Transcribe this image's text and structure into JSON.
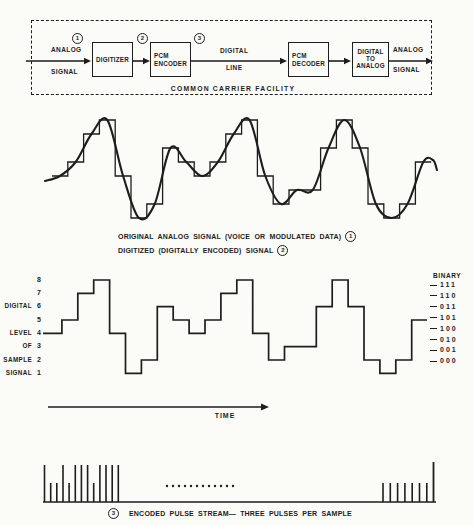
{
  "page": {
    "background": "#fbfbf8",
    "ink": "#1d1d1d"
  },
  "block_diagram": {
    "marker_1": "1",
    "marker_2": "2",
    "marker_3": "3",
    "input_top": "ANALOG",
    "input_bottom": "SIGNAL",
    "digitizer_label": "DIGITIZER",
    "encoder_line1": "PCM",
    "encoder_line2": "ENCODER",
    "line_label_top": "DIGITAL",
    "line_label_bottom": "LINE",
    "decoder_line1": "PCM",
    "decoder_line2": "DECODER",
    "da_line1": "DIGITAL",
    "da_line2": "TO",
    "da_line3": "ANALOG",
    "output_top": "ANALOG",
    "output_bottom": "SIGNAL",
    "facility_label": "COMMON CARRIER FACILITY"
  },
  "captions": {
    "analog_text": "ORIGINAL ANALOG SIGNAL (VOICE OR MODULATED DATA)",
    "analog_marker": "1",
    "digitized_text": "DIGITIZED (DIGITALLY ENCODED) SIGNAL",
    "digitized_marker": "2",
    "pulse_marker": "3",
    "pulse_text": "ENCODED PULSE STREAM— THREE PULSES PER SAMPLE"
  },
  "digital_chart": {
    "time_label": "TIME",
    "binary_header": "BINARY",
    "level_rows": [
      {
        "word": "",
        "num": "8"
      },
      {
        "word": "",
        "num": "7"
      },
      {
        "word": "DIGITAL",
        "num": "6"
      },
      {
        "word": "",
        "num": "5"
      },
      {
        "word": "LEVEL",
        "num": "4"
      },
      {
        "word": "OF",
        "num": "3"
      },
      {
        "word": "SAMPLE",
        "num": "2"
      },
      {
        "word": "SIGNAL",
        "num": "1"
      }
    ],
    "binary_rows": [
      "111",
      "110",
      "011",
      "101",
      "100",
      "010",
      "001",
      "000"
    ]
  },
  "chart_data": [
    {
      "type": "line",
      "name": "analog-and-digitized-signal",
      "title": "ORIGINAL ANALOG SIGNAL (VOICE OR MODULATED DATA) / DIGITIZED (DIGITALLY ENCODED) SIGNAL",
      "series": [
        {
          "name": "digitized staircase",
          "values": [
            4,
            5,
            7,
            8,
            4,
            1,
            2,
            6,
            5,
            4,
            5,
            7,
            8,
            4,
            2,
            3,
            3,
            6,
            8,
            6,
            2,
            1,
            2,
            5
          ]
        },
        {
          "name": "original analog curve",
          "values": [
            4,
            5,
            7,
            8,
            4,
            1,
            2,
            6,
            5,
            4,
            5,
            7,
            8,
            4,
            2,
            3,
            3,
            6,
            8,
            6,
            2,
            1,
            2,
            5
          ]
        }
      ],
      "ylim": [
        1,
        8
      ],
      "grid": false
    },
    {
      "type": "line",
      "name": "digital-level-staircase",
      "title": "DIGITAL LEVEL OF SAMPLE SIGNAL",
      "sample_levels": [
        4,
        5,
        7,
        8,
        4,
        1,
        2,
        6,
        5,
        4,
        5,
        7,
        8,
        4,
        2,
        3,
        3,
        6,
        8,
        6,
        2,
        1,
        2,
        5
      ],
      "level_ticks": [
        8,
        7,
        6,
        5,
        4,
        3,
        2,
        1
      ],
      "binary_ticks": [
        "111",
        "110",
        "011",
        "101",
        "100",
        "010",
        "001",
        "000"
      ],
      "xlabel": "TIME",
      "ylabel": "DIGITAL LEVEL OF SAMPLE SIGNAL",
      "ylim": [
        1,
        8
      ],
      "grid": false
    },
    {
      "type": "bar",
      "name": "encoded-pulse-stream",
      "title": "ENCODED PULSE STREAM — THREE PULSES PER SAMPLE",
      "left_pulses": [
        1,
        0,
        0,
        1,
        0,
        1,
        1,
        1,
        0,
        1,
        1,
        1,
        1
      ],
      "gap_dots": 12,
      "right_pulses": [
        0,
        0,
        0,
        0,
        0,
        0,
        0
      ],
      "final_tall_pulse": 1
    }
  ]
}
